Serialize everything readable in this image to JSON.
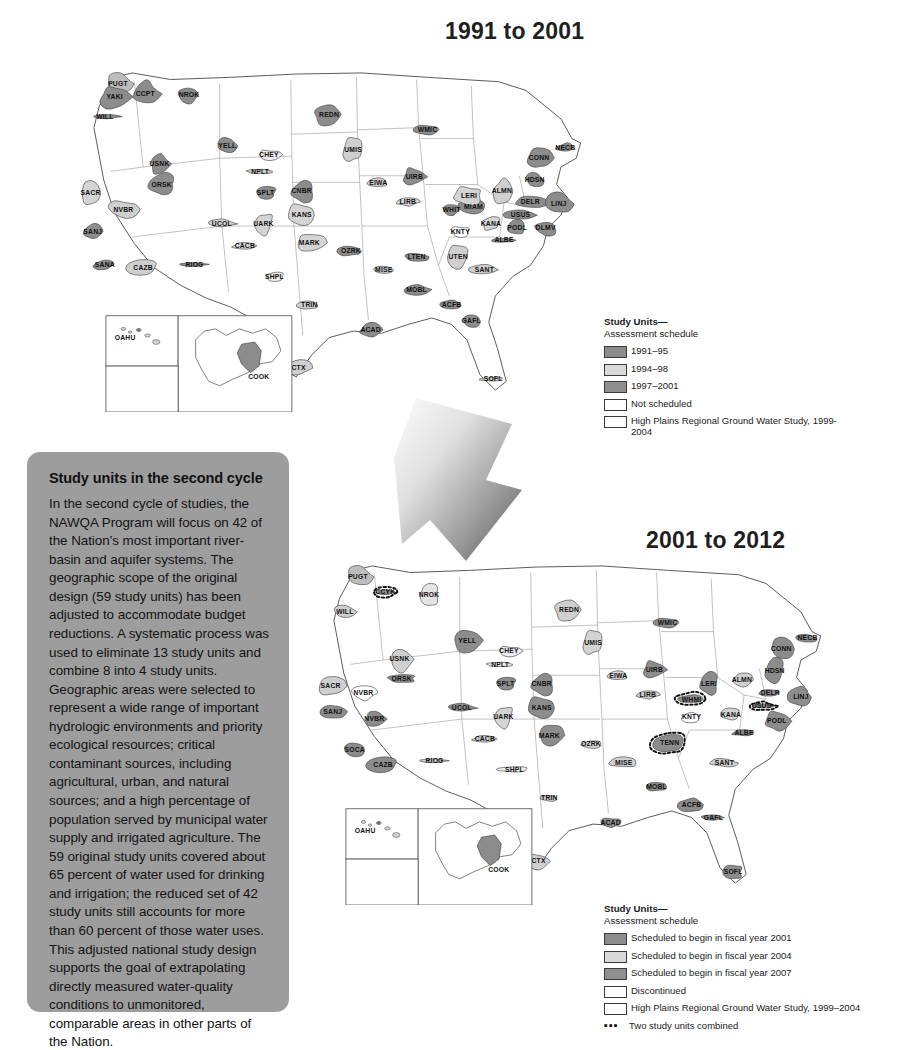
{
  "maps": [
    {
      "id": "top",
      "title": "1991 to 2001",
      "legend": {
        "title": "Study Units—",
        "subtitle": "Assessment schedule",
        "entries": [
          {
            "label": "1991–95",
            "color": "#8c8c8c",
            "type": "swatch"
          },
          {
            "label": "1994–98",
            "color": "#d9d9d9",
            "type": "swatch"
          },
          {
            "label": "1997–2001",
            "color": "#8f8f8f",
            "type": "swatch"
          },
          {
            "label": "Not scheduled",
            "color": "#ffffff",
            "type": "swatch"
          },
          {
            "label": "High Plains Regional Ground Water Study, 1999-2004",
            "color": "#fdfdfd",
            "type": "swatch"
          }
        ]
      },
      "insets": [
        {
          "name": "hawaii-inset",
          "label": "OAHU"
        },
        {
          "name": "alaska-inset",
          "label": "COOK"
        }
      ],
      "study_units": [
        {
          "code": "PUGT",
          "x": 47,
          "y": 20,
          "fill": "#bdbdbd"
        },
        {
          "code": "YAKI",
          "x": 44,
          "y": 32,
          "fill": "#8c8c8c"
        },
        {
          "code": "CCPT",
          "x": 72,
          "y": 29,
          "fill": "#8c8c8c"
        },
        {
          "code": "NROK",
          "x": 112,
          "y": 30,
          "fill": "#8c8c8c"
        },
        {
          "code": "WILL",
          "x": 35,
          "y": 50,
          "fill": "#8f8f8f"
        },
        {
          "code": "USNK",
          "x": 85,
          "y": 93,
          "fill": "#8c8c8c"
        },
        {
          "code": "ORSK",
          "x": 87,
          "y": 112,
          "fill": "#8c8c8c"
        },
        {
          "code": "YELL",
          "x": 147,
          "y": 77,
          "fill": "#8c8c8c"
        },
        {
          "code": "SACR",
          "x": 22,
          "y": 120,
          "fill": "#d4d4d4"
        },
        {
          "code": "NVBR",
          "x": 52,
          "y": 135,
          "fill": "#cfcfcf"
        },
        {
          "code": "SANJ",
          "x": 24,
          "y": 155,
          "fill": "#8c8c8c"
        },
        {
          "code": "SANA",
          "x": 35,
          "y": 185,
          "fill": "#8c8c8c"
        },
        {
          "code": "CAZB",
          "x": 70,
          "y": 188,
          "fill": "#cfcfcf"
        },
        {
          "code": "RIOG",
          "x": 117,
          "y": 185,
          "fill": "#8c8c8c"
        },
        {
          "code": "NPLT",
          "x": 177,
          "y": 100,
          "fill": "#d4d4d4"
        },
        {
          "code": "UCOL",
          "x": 142,
          "y": 148,
          "fill": "#d4d4d4"
        },
        {
          "code": "CHEY",
          "x": 185,
          "y": 85,
          "fill": "#eeeeee"
        },
        {
          "code": "SPLT",
          "x": 182,
          "y": 120,
          "fill": "#8c8c8c"
        },
        {
          "code": "UARK",
          "x": 180,
          "y": 148,
          "fill": "#d4d4d4"
        },
        {
          "code": "CACB",
          "x": 163,
          "y": 168,
          "fill": "#dddddd"
        },
        {
          "code": "KANS",
          "x": 215,
          "y": 140,
          "fill": "#d4d4d4"
        },
        {
          "code": "CNBR",
          "x": 215,
          "y": 118,
          "fill": "#8c8c8c"
        },
        {
          "code": "REDN",
          "x": 240,
          "y": 48,
          "fill": "#8c8c8c"
        },
        {
          "code": "UMIS",
          "x": 262,
          "y": 80,
          "fill": "#cfcfcf"
        },
        {
          "code": "EIWA",
          "x": 285,
          "y": 110,
          "fill": "#d4d4d4"
        },
        {
          "code": "WMIC",
          "x": 330,
          "y": 62,
          "fill": "#8c8c8c"
        },
        {
          "code": "UIRB",
          "x": 318,
          "y": 105,
          "fill": "#8c8c8c"
        },
        {
          "code": "LIRB",
          "x": 312,
          "y": 128,
          "fill": "#d4d4d4"
        },
        {
          "code": "WHIT",
          "x": 352,
          "y": 135,
          "fill": "#8c8c8c"
        },
        {
          "code": "MIAM",
          "x": 372,
          "y": 132,
          "fill": "#8c8c8c"
        },
        {
          "code": "OZRK",
          "x": 260,
          "y": 173,
          "fill": "#8c8c8c"
        },
        {
          "code": "MARK",
          "x": 222,
          "y": 165,
          "fill": "#d4d4d4"
        },
        {
          "code": "SHPL",
          "x": 190,
          "y": 196,
          "fill": "#eeeeee"
        },
        {
          "code": "TRIN",
          "x": 222,
          "y": 222,
          "fill": "#cfcfcf"
        },
        {
          "code": "SCTX",
          "x": 210,
          "y": 280,
          "fill": "#cfcfcf"
        },
        {
          "code": "ACAD",
          "x": 278,
          "y": 245,
          "fill": "#8c8c8c"
        },
        {
          "code": "MISE",
          "x": 290,
          "y": 190,
          "fill": "#cfcfcf"
        },
        {
          "code": "LTEN",
          "x": 320,
          "y": 178,
          "fill": "#8c8c8c"
        },
        {
          "code": "MOBL",
          "x": 320,
          "y": 208,
          "fill": "#8c8c8c"
        },
        {
          "code": "ACFB",
          "x": 352,
          "y": 222,
          "fill": "#8c8c8c"
        },
        {
          "code": "GAFL",
          "x": 370,
          "y": 237,
          "fill": "#8c8c8c"
        },
        {
          "code": "SOFL",
          "x": 390,
          "y": 290,
          "fill": "#cfcfcf"
        },
        {
          "code": "SANT",
          "x": 382,
          "y": 190,
          "fill": "#cfcfcf"
        },
        {
          "code": "UTEN",
          "x": 358,
          "y": 178,
          "fill": "#cfcfcf"
        },
        {
          "code": "ALBE",
          "x": 400,
          "y": 163,
          "fill": "#8c8c8c"
        },
        {
          "code": "KNTY",
          "x": 360,
          "y": 155,
          "fill": "#ffffff"
        },
        {
          "code": "KANA",
          "x": 388,
          "y": 148,
          "fill": "#d4d4d4"
        },
        {
          "code": "LERI",
          "x": 368,
          "y": 122,
          "fill": "#d4d4d4"
        },
        {
          "code": "ALMN",
          "x": 398,
          "y": 118,
          "fill": "#cfcfcf"
        },
        {
          "code": "USUS",
          "x": 415,
          "y": 140,
          "fill": "#8c8c8c"
        },
        {
          "code": "PODL",
          "x": 412,
          "y": 152,
          "fill": "#8c8c8c"
        },
        {
          "code": "DLMV",
          "x": 438,
          "y": 152,
          "fill": "#8c8c8c"
        },
        {
          "code": "DELR",
          "x": 424,
          "y": 128,
          "fill": "#8c8c8c"
        },
        {
          "code": "LINJ",
          "x": 450,
          "y": 130,
          "fill": "#8c8c8c"
        },
        {
          "code": "HDSN",
          "x": 428,
          "y": 108,
          "fill": "#8c8c8c"
        },
        {
          "code": "CONN",
          "x": 432,
          "y": 88,
          "fill": "#8c8c8c"
        },
        {
          "code": "NECB",
          "x": 456,
          "y": 78,
          "fill": "#8c8c8c"
        }
      ]
    },
    {
      "id": "bottom",
      "title": "2001 to 2012",
      "legend": {
        "title": "Study Units—",
        "subtitle": "Assessment schedule",
        "entries": [
          {
            "label": "Scheduled to begin in fiscal year 2001",
            "color": "#8c8c8c",
            "type": "swatch"
          },
          {
            "label": "Scheduled to begin in fiscal year 2004",
            "color": "#d9d9d9",
            "type": "swatch"
          },
          {
            "label": "Scheduled to begin in fiscal year 2007",
            "color": "#8f8f8f",
            "type": "swatch"
          },
          {
            "label": "Discontinued",
            "color": "#ffffff",
            "type": "swatch"
          },
          {
            "label": "High Plains Regional Ground Water Study, 1999–2004",
            "color": "#fdfdfd",
            "type": "swatch"
          },
          {
            "label": "Two study units combined",
            "color": "#111111",
            "type": "dashes",
            "mark": "▪▪▪"
          }
        ]
      },
      "insets": [
        {
          "name": "hawaii-inset",
          "label": "OAHU"
        },
        {
          "name": "alaska-inset",
          "label": "COOK"
        }
      ],
      "study_units": [
        {
          "code": "PUGT",
          "x": 47,
          "y": 20,
          "fill": "#bdbdbd"
        },
        {
          "code": "CCYK",
          "x": 72,
          "y": 34,
          "fill": "#8c8c8c",
          "combined": true
        },
        {
          "code": "NROK",
          "x": 112,
          "y": 36,
          "fill": "#e4e4e4"
        },
        {
          "code": "WILL",
          "x": 35,
          "y": 52,
          "fill": "#cfcfcf"
        },
        {
          "code": "USNK",
          "x": 85,
          "y": 95,
          "fill": "#cfcfcf"
        },
        {
          "code": "ORSK",
          "x": 87,
          "y": 113,
          "fill": "#8c8c8c"
        },
        {
          "code": "YELL",
          "x": 147,
          "y": 78,
          "fill": "#8c8c8c"
        },
        {
          "code": "SACR",
          "x": 22,
          "y": 120,
          "fill": "#cfcfcf"
        },
        {
          "code": "NVBR",
          "x": 52,
          "y": 126,
          "fill": "#ffffff"
        },
        {
          "code": "SANJ",
          "x": 24,
          "y": 143,
          "fill": "#8c8c8c"
        },
        {
          "code": "NVBR",
          "x": 62,
          "y": 150,
          "fill": "#8c8c8c"
        },
        {
          "code": "SOCA",
          "x": 44,
          "y": 178,
          "fill": "#8c8c8c"
        },
        {
          "code": "CAZB",
          "x": 70,
          "y": 192,
          "fill": "#8c8c8c"
        },
        {
          "code": "RIOG",
          "x": 117,
          "y": 188,
          "fill": "#cfcfcf"
        },
        {
          "code": "NPLT",
          "x": 177,
          "y": 100,
          "fill": "#eeeeee"
        },
        {
          "code": "UCOL",
          "x": 142,
          "y": 140,
          "fill": "#8c8c8c"
        },
        {
          "code": "CHEY",
          "x": 185,
          "y": 88,
          "fill": "#eeeeee"
        },
        {
          "code": "SPLT",
          "x": 182,
          "y": 118,
          "fill": "#8c8c8c"
        },
        {
          "code": "UARK",
          "x": 180,
          "y": 148,
          "fill": "#d4d4d4"
        },
        {
          "code": "CACB",
          "x": 163,
          "y": 168,
          "fill": "#cfcfcf"
        },
        {
          "code": "KANS",
          "x": 215,
          "y": 140,
          "fill": "#8c8c8c"
        },
        {
          "code": "CNBR",
          "x": 215,
          "y": 118,
          "fill": "#8c8c8c"
        },
        {
          "code": "REDN",
          "x": 240,
          "y": 50,
          "fill": "#cfcfcf"
        },
        {
          "code": "UMIS",
          "x": 262,
          "y": 80,
          "fill": "#d4d4d4"
        },
        {
          "code": "EIWA",
          "x": 285,
          "y": 110,
          "fill": "#d4d4d4"
        },
        {
          "code": "WMIC",
          "x": 330,
          "y": 62,
          "fill": "#8c8c8c"
        },
        {
          "code": "UIRB",
          "x": 318,
          "y": 105,
          "fill": "#8c8c8c"
        },
        {
          "code": "LIRB",
          "x": 312,
          "y": 128,
          "fill": "#cfcfcf"
        },
        {
          "code": "WHMI",
          "x": 352,
          "y": 132,
          "fill": "#8c8c8c",
          "combined": true
        },
        {
          "code": "OZRK",
          "x": 260,
          "y": 173,
          "fill": "#d4d4d4"
        },
        {
          "code": "MARK",
          "x": 222,
          "y": 165,
          "fill": "#8c8c8c"
        },
        {
          "code": "SHPL",
          "x": 190,
          "y": 196,
          "fill": "#eeeeee"
        },
        {
          "code": "TRIN",
          "x": 222,
          "y": 222,
          "fill": "#cfcfcf"
        },
        {
          "code": "SCTX",
          "x": 210,
          "y": 280,
          "fill": "#cfcfcf"
        },
        {
          "code": "ACAD",
          "x": 278,
          "y": 245,
          "fill": "#8c8c8c"
        },
        {
          "code": "MISE",
          "x": 290,
          "y": 190,
          "fill": "#cfcfcf"
        },
        {
          "code": "TENN",
          "x": 332,
          "y": 172,
          "fill": "#8c8c8c",
          "combined": true
        },
        {
          "code": "MOBL",
          "x": 320,
          "y": 212,
          "fill": "#8c8c8c"
        },
        {
          "code": "ACFB",
          "x": 352,
          "y": 228,
          "fill": "#8c8c8c"
        },
        {
          "code": "GAFL",
          "x": 372,
          "y": 240,
          "fill": "#8c8c8c"
        },
        {
          "code": "SOFL",
          "x": 390,
          "y": 290,
          "fill": "#8c8c8c"
        },
        {
          "code": "SANT",
          "x": 382,
          "y": 190,
          "fill": "#cfcfcf"
        },
        {
          "code": "KNTY",
          "x": 352,
          "y": 148,
          "fill": "#ffffff"
        },
        {
          "code": "KANA",
          "x": 388,
          "y": 146,
          "fill": "#d4d4d4"
        },
        {
          "code": "LERI",
          "x": 368,
          "y": 118,
          "fill": "#8c8c8c"
        },
        {
          "code": "ALMN",
          "x": 398,
          "y": 114,
          "fill": "#cfcfcf"
        },
        {
          "code": "USUS",
          "x": 416,
          "y": 138,
          "fill": "#8c8c8c",
          "combined": true
        },
        {
          "code": "PODL",
          "x": 430,
          "y": 152,
          "fill": "#8c8c8c"
        },
        {
          "code": "DELR",
          "x": 424,
          "y": 126,
          "fill": "#8c8c8c"
        },
        {
          "code": "LINJ",
          "x": 452,
          "y": 130,
          "fill": "#8c8c8c"
        },
        {
          "code": "HDSN",
          "x": 428,
          "y": 106,
          "fill": "#8c8c8c"
        },
        {
          "code": "CONN",
          "x": 434,
          "y": 86,
          "fill": "#8c8c8c"
        },
        {
          "code": "NECB",
          "x": 458,
          "y": 76,
          "fill": "#8c8c8c"
        },
        {
          "code": "ALBE",
          "x": 400,
          "y": 163,
          "fill": "#8c8c8c"
        }
      ]
    }
  ],
  "panel": {
    "heading": "Study units in the second cycle",
    "body": "In the second cycle of studies, the NAWQA Program will focus on 42 of the Nation’s most important river-basin and aquifer systems. The geographic scope of the original design (59 study units) has been adjusted to accommodate budget reductions. A systematic process was used to eliminate 13 study units and combine 8 into 4 study units. Geographic areas were selected to represent a wide range of important hydrologic environments and priority ecological resources; critical contaminant sources, including agricultural, urban, and natural sources; and a high percentage of population served by municipal water supply and irrigated agriculture. The 59 original study units covered about 65 percent of water used for drinking and irrigation; the reduced set of 42 study units still accounts for more than 60 percent of those water uses. This adjusted national study design supports the goal of extrapolating directly measured water-quality conditions to unmonitored, comparable areas in other parts of the Nation."
  },
  "arrow": {
    "name": "transition-arrow",
    "direction": "down-right"
  }
}
